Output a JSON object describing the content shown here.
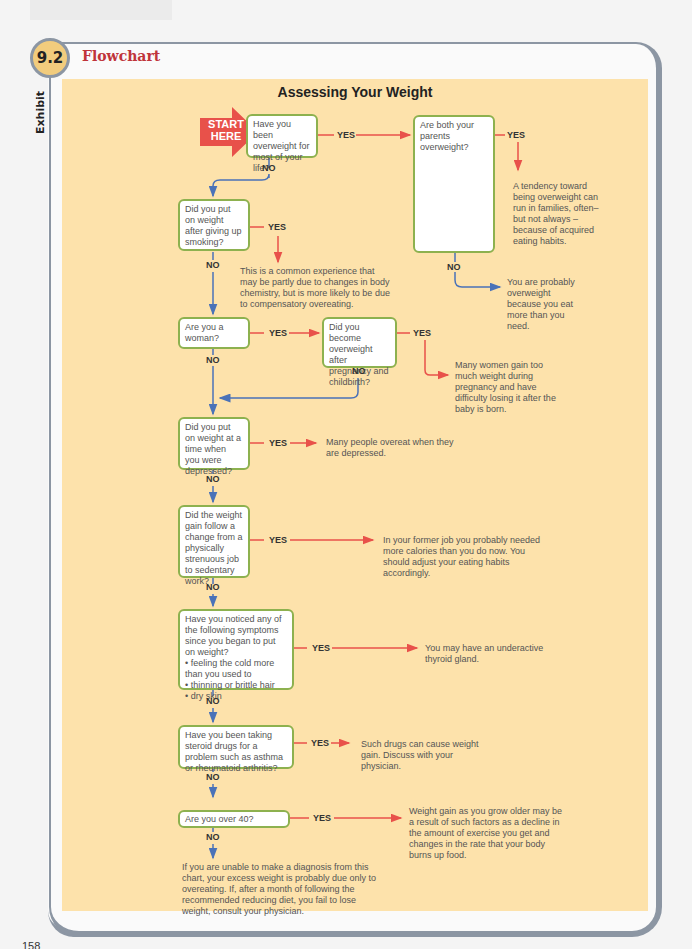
{
  "exhibit": {
    "number": "9.2",
    "section_title": "Flowchart",
    "side_label": "Exhibit"
  },
  "flowchart": {
    "title": "Assessing Your Weight",
    "start_label": "START HERE",
    "yes_label": "YES",
    "no_label": "NO",
    "colors": {
      "yes_arrow": "#e8514a",
      "no_arrow": "#4a72b8",
      "box_border": "#8db14f",
      "panel_bg": "#fde2ab",
      "title_red": "#c0343a"
    },
    "questions": [
      {
        "id": "q1",
        "text": "Have you been overweight for most of your life?"
      },
      {
        "id": "q1b",
        "text": "Are both your parents overweight?"
      },
      {
        "id": "q2",
        "text": "Did you put on weight after giving up smoking?"
      },
      {
        "id": "q3",
        "text": "Are you a woman?"
      },
      {
        "id": "q3b",
        "text": "Did you become overweight after pregnancy and childbirth?"
      },
      {
        "id": "q4",
        "text": "Did you put on weight at a time when you were depressed?"
      },
      {
        "id": "q5",
        "text": "Did the weight gain follow a change from a physically strenuous job to sedentary work?"
      },
      {
        "id": "q6",
        "text": "Have you noticed any of the following symptoms since you began to put on weight?",
        "bullets": [
          "feeling the cold more than you used to",
          "thinning or brittle hair",
          "dry skin"
        ]
      },
      {
        "id": "q7",
        "text": "Have you been taking steroid drugs for a problem such as asthma or rheumatoid arthritis?"
      },
      {
        "id": "q8",
        "text": "Are you over 40?"
      }
    ],
    "outcomes": [
      {
        "id": "o1b_yes",
        "text": "A tendency toward being overweight can run in families, often–but not always –because of acquired eating habits."
      },
      {
        "id": "o1b_no",
        "text": "You are probably overweight because you eat more than you need."
      },
      {
        "id": "o2_yes",
        "text": "This is a common experience that may be partly due to changes in body chemistry, but is more likely to be due to compensatory overeating."
      },
      {
        "id": "o3b_yes",
        "text": "Many women gain too much weight during pregnancy and have difficulty losing it after the baby is born."
      },
      {
        "id": "o4_yes",
        "text": "Many people overeat when they are depressed."
      },
      {
        "id": "o5_yes",
        "text": "In your former job you probably needed more calories than you do now. You should adjust your eating habits accordingly."
      },
      {
        "id": "o6_yes",
        "text": "You may have an underactive thyroid gland."
      },
      {
        "id": "o7_yes",
        "text": "Such drugs can cause weight gain. Discuss with your physician."
      },
      {
        "id": "o8_yes",
        "text": "Weight gain as you grow older may be a result of such factors as a decline in the amount of exercise you get and changes in the rate that your body burns up food."
      },
      {
        "id": "o8_no",
        "text": "If you are unable to make a diagnosis from this chart, your excess weight is probably due only to overeating. If, after a month of following the recommended reducing diet, you fail to lose weight, consult your physician."
      }
    ]
  },
  "page": {
    "number": "158"
  }
}
